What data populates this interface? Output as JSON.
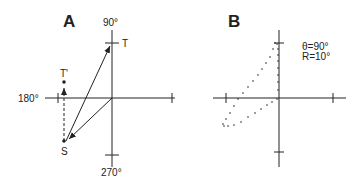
{
  "panel_a": {
    "label": "A",
    "axis_labels": {
      "top": "90°",
      "left": "180°",
      "right": "0°",
      "bottom": "270°"
    },
    "points": {
      "T": "T",
      "T_prime": "T'",
      "S": "S"
    }
  },
  "panel_b": {
    "label": "B",
    "theta_label": "θ=90°",
    "r_label": "R=10°"
  },
  "colors": {
    "ink": "#222222",
    "background": "#ffffff"
  }
}
